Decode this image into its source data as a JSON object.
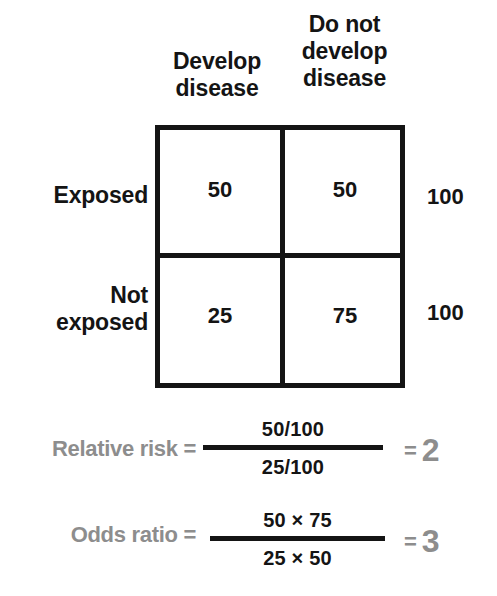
{
  "table": {
    "column_headers": [
      {
        "lines": [
          "Develop",
          "disease"
        ]
      },
      {
        "lines": [
          "Do not",
          "develop",
          "disease"
        ]
      }
    ],
    "row_headers": [
      {
        "lines": [
          "Exposed"
        ]
      },
      {
        "lines": [
          "Not",
          "exposed"
        ]
      }
    ],
    "cells": [
      [
        "50",
        "50"
      ],
      [
        "25",
        "75"
      ]
    ],
    "row_totals": [
      "100",
      "100"
    ],
    "border_color": "#141414"
  },
  "formulas": [
    {
      "label": "Relative risk =",
      "numerator": "50/100",
      "denominator": "25/100",
      "equals": "=",
      "result": "2"
    },
    {
      "label": "Odds ratio =",
      "numerator": "50 × 75",
      "denominator": "25 × 50",
      "equals": "=",
      "result": "3"
    }
  ],
  "colors": {
    "ink": "#141414",
    "muted": "#8d8d8d",
    "background": "#ffffff"
  }
}
